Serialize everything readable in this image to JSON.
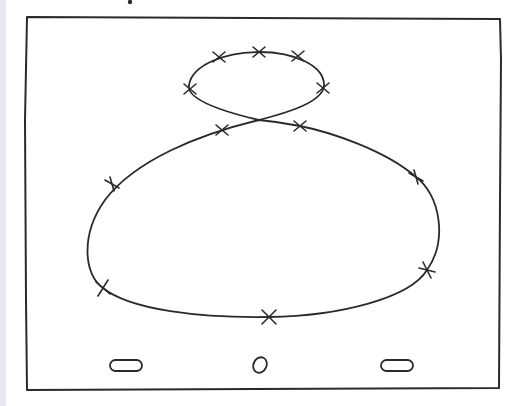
{
  "diagram": {
    "colors": {
      "ink": "#2a2a2a",
      "paper": "#ffffff",
      "edge_strip": "#e6e7f2"
    },
    "frame": {
      "x": 25,
      "y": 17,
      "width": 477,
      "height": 373
    },
    "top_dot": {
      "x": 130,
      "y": 2
    },
    "path": {
      "shape": "figure-eight",
      "upper_loop": {
        "cx": 257,
        "cy": 83,
        "rx": 70,
        "ry": 32
      },
      "crossing": {
        "x": 259,
        "y": 120
      },
      "lower_loop": {
        "left_x": 87,
        "right_x": 444,
        "top_y": 120,
        "bottom_y": 318
      }
    },
    "markers": [
      {
        "id": 1,
        "x": 219,
        "y": 57
      },
      {
        "id": 2,
        "x": 259,
        "y": 52
      },
      {
        "id": 3,
        "x": 298,
        "y": 56
      },
      {
        "id": 4,
        "x": 190,
        "y": 89
      },
      {
        "id": 5,
        "x": 323,
        "y": 88
      },
      {
        "id": 6,
        "x": 222,
        "y": 130
      },
      {
        "id": 7,
        "x": 300,
        "y": 126
      },
      {
        "id": 8,
        "x": 112,
        "y": 184
      },
      {
        "id": 9,
        "x": 416,
        "y": 177
      },
      {
        "id": 10,
        "x": 103,
        "y": 288
      },
      {
        "id": 11,
        "x": 427,
        "y": 270
      },
      {
        "id": 12,
        "x": 269,
        "y": 317
      }
    ],
    "nav_buttons": [
      {
        "name": "left-pill-button",
        "shape": "pill",
        "cx": 126,
        "cy": 365,
        "w": 32,
        "h": 11
      },
      {
        "name": "home-circle-button",
        "shape": "circle",
        "cx": 260,
        "cy": 365,
        "rx": 7,
        "ry": 8
      },
      {
        "name": "right-pill-button",
        "shape": "pill",
        "cx": 397,
        "cy": 365,
        "w": 32,
        "h": 11
      }
    ]
  }
}
